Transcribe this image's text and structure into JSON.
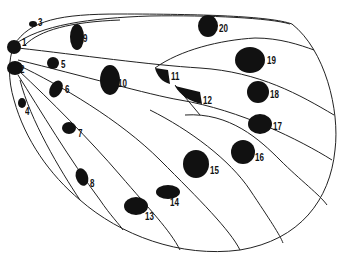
{
  "diagram": {
    "title": "",
    "spots": [
      {
        "id": "1",
        "label": "1",
        "x": 22,
        "y": 38
      },
      {
        "id": "2",
        "label": "2",
        "x": 20,
        "y": 65
      },
      {
        "id": "3",
        "label": "3",
        "x": 38,
        "y": 18
      },
      {
        "id": "4",
        "label": "4",
        "x": 25,
        "y": 107
      },
      {
        "id": "5",
        "label": "5",
        "x": 61,
        "y": 60
      },
      {
        "id": "6",
        "label": "6",
        "x": 65,
        "y": 85
      },
      {
        "id": "7",
        "label": "7",
        "x": 78,
        "y": 129
      },
      {
        "id": "8",
        "label": "8",
        "x": 90,
        "y": 179
      },
      {
        "id": "9",
        "label": "9",
        "x": 83,
        "y": 34
      },
      {
        "id": "10",
        "label": "10",
        "x": 118,
        "y": 79
      },
      {
        "id": "11",
        "label": "11",
        "x": 171,
        "y": 72
      },
      {
        "id": "12",
        "label": "12",
        "x": 203,
        "y": 96
      },
      {
        "id": "13",
        "label": "13",
        "x": 145,
        "y": 212
      },
      {
        "id": "14",
        "label": "14",
        "x": 170,
        "y": 198
      },
      {
        "id": "15",
        "label": "15",
        "x": 210,
        "y": 166
      },
      {
        "id": "16",
        "label": "16",
        "x": 255,
        "y": 153
      },
      {
        "id": "17",
        "label": "17",
        "x": 273,
        "y": 122
      },
      {
        "id": "18",
        "label": "18",
        "x": 270,
        "y": 90
      },
      {
        "id": "19",
        "label": "19",
        "x": 267,
        "y": 56
      },
      {
        "id": "20",
        "label": "20",
        "x": 219,
        "y": 24
      }
    ]
  }
}
